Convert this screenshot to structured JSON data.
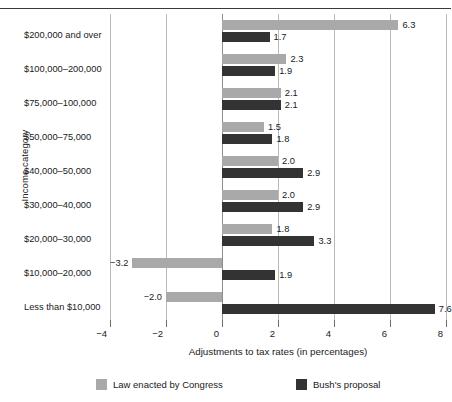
{
  "chart_data": {
    "type": "bar",
    "orientation": "horizontal",
    "title": "",
    "xlabel": "Adjustments to tax rates (in percentages)",
    "ylabel": "Income category",
    "xlim": [
      -4,
      8
    ],
    "xticks": [
      -4,
      -2,
      0,
      2,
      4,
      6,
      8
    ],
    "xtick_labels": [
      "−4",
      "−2",
      "0",
      "2",
      "4",
      "6",
      "8"
    ],
    "grid": true,
    "legend_position": "bottom",
    "categories": [
      "$200,000 and over",
      "$100,000–200,000",
      "$75,000–100,000",
      "$50,000–75,000",
      "$40,000–50,000",
      "$30,000–40,000",
      "$20,000–30,000",
      "$10,000–20,000",
      "Less than $10,000"
    ],
    "series": [
      {
        "name": "Law enacted by Congress",
        "color": "#a9a9a9",
        "values": [
          6.3,
          2.3,
          2.1,
          1.5,
          2.0,
          2.0,
          1.8,
          -3.2,
          -2.0
        ],
        "labels": [
          "6.3",
          "2.3",
          "2.1",
          "1.5",
          "2.0",
          "2.0",
          "1.8",
          "−3.2",
          "−2.0"
        ]
      },
      {
        "name": "Bush's proposal",
        "color": "#333333",
        "values": [
          1.7,
          1.9,
          2.1,
          1.8,
          2.9,
          2.9,
          3.3,
          1.9,
          7.6
        ],
        "labels": [
          "1.7",
          "1.9",
          "2.1",
          "1.8",
          "2.9",
          "2.9",
          "3.3",
          "1.9",
          "7.6"
        ]
      }
    ]
  },
  "legend": {
    "items": [
      {
        "label": "Law enacted by Congress",
        "color": "#a9a9a9"
      },
      {
        "label": "Bush's proposal",
        "color": "#333333"
      }
    ]
  }
}
